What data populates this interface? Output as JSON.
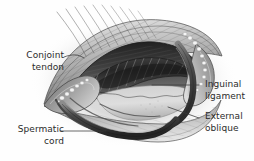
{
  "figure": {
    "background_color": "#fefefe",
    "label_color": "#2b2b2b",
    "leader_line_color": "#3a3a3a"
  },
  "labels": {
    "conjoint_tendon": {
      "line1": "Conjoint",
      "line2": "tendon",
      "align": "right"
    },
    "spermatic_cord": {
      "line1": "Spermatic",
      "line2": "cord",
      "align": "right"
    },
    "inguinal_ligament": {
      "line1": "Inguinal",
      "line2": "ligament",
      "align": "left"
    },
    "external_oblique": {
      "line1": "External",
      "line2": "oblique",
      "align": "left"
    }
  },
  "illustration": {
    "style": "grayscale pen-and-ink medical illustration",
    "subject": "open inguinal canal with retracted external oblique aponeurosis",
    "structures": [
      "conjoint tendon",
      "spermatic cord",
      "inguinal ligament",
      "external oblique aponeurosis",
      "fat globules",
      "striated muscle fibers",
      "cut fascial fibers"
    ],
    "palette": {
      "lightest": "#f2f2f2",
      "light": "#d8d8d8",
      "mid": "#a8a8a8",
      "dark": "#666666",
      "darkest": "#242424",
      "shadow": "#cfcfcf"
    }
  }
}
